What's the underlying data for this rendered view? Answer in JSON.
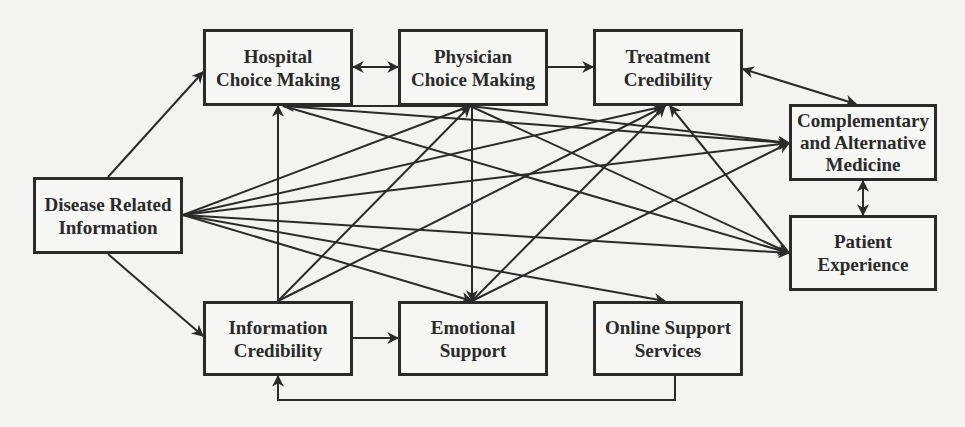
{
  "diagram": {
    "type": "conceptual-model",
    "nodes": [
      {
        "id": "disease",
        "lines": [
          "Disease Related",
          "Information"
        ],
        "x": 33,
        "y": 177,
        "w": 150,
        "h": 77
      },
      {
        "id": "hospital",
        "lines": [
          "Hospital",
          "Choice Making"
        ],
        "x": 203,
        "y": 29,
        "w": 150,
        "h": 77
      },
      {
        "id": "physician",
        "lines": [
          "Physician",
          "Choice Making"
        ],
        "x": 398,
        "y": 29,
        "w": 150,
        "h": 77
      },
      {
        "id": "treatment",
        "lines": [
          "Treatment",
          "Credibility"
        ],
        "x": 593,
        "y": 29,
        "w": 150,
        "h": 77
      },
      {
        "id": "cam",
        "lines": [
          "Complementary",
          "and Alternative",
          "Medicine"
        ],
        "x": 789,
        "y": 104,
        "w": 148,
        "h": 77
      },
      {
        "id": "patient",
        "lines": [
          "Patient",
          "Experience"
        ],
        "x": 789,
        "y": 215,
        "w": 148,
        "h": 76
      },
      {
        "id": "infocred",
        "lines": [
          "Information",
          "Credibility"
        ],
        "x": 203,
        "y": 301,
        "w": 150,
        "h": 75
      },
      {
        "id": "emotional",
        "lines": [
          "Emotional",
          "Support"
        ],
        "x": 398,
        "y": 301,
        "w": 150,
        "h": 75
      },
      {
        "id": "online",
        "lines": [
          "Online Support",
          "Services"
        ],
        "x": 593,
        "y": 301,
        "w": 150,
        "h": 75
      }
    ],
    "edges": [
      {
        "from": "disease",
        "to": "hospital",
        "pts": [
          [
            108,
            177
          ],
          [
            203,
            72
          ]
        ],
        "bidirectional": false
      },
      {
        "from": "disease",
        "to": "infocred",
        "pts": [
          [
            108,
            254
          ],
          [
            203,
            336
          ]
        ],
        "bidirectional": false
      },
      {
        "from": "disease",
        "to": "physician",
        "pts": [
          [
            183,
            215
          ],
          [
            470,
            106
          ]
        ],
        "bidirectional": false
      },
      {
        "from": "disease",
        "to": "treatment",
        "pts": [
          [
            183,
            215
          ],
          [
            665,
            106
          ]
        ],
        "bidirectional": false
      },
      {
        "from": "disease",
        "to": "cam",
        "pts": [
          [
            183,
            215
          ],
          [
            789,
            143
          ]
        ],
        "bidirectional": false
      },
      {
        "from": "disease",
        "to": "patient",
        "pts": [
          [
            183,
            215
          ],
          [
            789,
            253
          ]
        ],
        "bidirectional": false
      },
      {
        "from": "disease",
        "to": "emotional",
        "pts": [
          [
            183,
            215
          ],
          [
            472,
            301
          ]
        ],
        "bidirectional": false
      },
      {
        "from": "disease",
        "to": "online",
        "pts": [
          [
            183,
            215
          ],
          [
            665,
            301
          ]
        ],
        "bidirectional": false
      },
      {
        "from": "hospital",
        "to": "physician",
        "pts": [
          [
            353,
            67
          ],
          [
            398,
            67
          ]
        ],
        "bidirectional": true
      },
      {
        "from": "physician",
        "to": "treatment",
        "pts": [
          [
            548,
            67
          ],
          [
            593,
            67
          ]
        ],
        "bidirectional": false
      },
      {
        "from": "treatment",
        "to": "cam",
        "pts": [
          [
            743,
            69
          ],
          [
            856,
            104
          ]
        ],
        "bidirectional": true
      },
      {
        "from": "cam",
        "to": "patient",
        "pts": [
          [
            863,
            181
          ],
          [
            863,
            215
          ]
        ],
        "bidirectional": true
      },
      {
        "from": "infocred",
        "to": "hospital",
        "pts": [
          [
            278,
            301
          ],
          [
            278,
            106
          ]
        ],
        "bidirectional": false
      },
      {
        "from": "infocred",
        "to": "physician",
        "pts": [
          [
            278,
            301
          ],
          [
            470,
            106
          ]
        ],
        "bidirectional": false
      },
      {
        "from": "infocred",
        "to": "treatment",
        "pts": [
          [
            278,
            301
          ],
          [
            665,
            106
          ]
        ],
        "bidirectional": false
      },
      {
        "from": "infocred",
        "to": "emotional",
        "pts": [
          [
            353,
            338
          ],
          [
            398,
            338
          ]
        ],
        "bidirectional": false
      },
      {
        "from": "physician",
        "to": "hospital",
        "pts": [
          [
            470,
            106
          ],
          [
            283,
            106
          ]
        ],
        "bidirectional": false
      },
      {
        "from": "physician",
        "to": "cam",
        "pts": [
          [
            470,
            106
          ],
          [
            789,
            143
          ]
        ],
        "bidirectional": false
      },
      {
        "from": "physician",
        "to": "patient",
        "pts": [
          [
            470,
            106
          ],
          [
            789,
            253
          ]
        ],
        "bidirectional": false
      },
      {
        "from": "physician",
        "to": "emotional",
        "pts": [
          [
            472,
            106
          ],
          [
            472,
            301
          ]
        ],
        "bidirectional": false
      },
      {
        "from": "hospital",
        "to": "cam",
        "pts": [
          [
            283,
            106
          ],
          [
            789,
            143
          ]
        ],
        "bidirectional": false
      },
      {
        "from": "hospital",
        "to": "patient",
        "pts": [
          [
            283,
            106
          ],
          [
            789,
            253
          ]
        ],
        "bidirectional": false
      },
      {
        "from": "emotional",
        "to": "treatment",
        "pts": [
          [
            472,
            301
          ],
          [
            665,
            106
          ]
        ],
        "bidirectional": false
      },
      {
        "from": "emotional",
        "to": "cam",
        "pts": [
          [
            472,
            301
          ],
          [
            789,
            143
          ]
        ],
        "bidirectional": false
      },
      {
        "from": "patient",
        "to": "treatment",
        "pts": [
          [
            789,
            253
          ],
          [
            670,
            106
          ]
        ],
        "bidirectional": false
      },
      {
        "from": "online",
        "to": "infocred",
        "pts": [
          [
            675,
            376
          ],
          [
            675,
            400
          ],
          [
            278,
            400
          ],
          [
            278,
            376
          ]
        ],
        "bidirectional": false
      }
    ]
  }
}
